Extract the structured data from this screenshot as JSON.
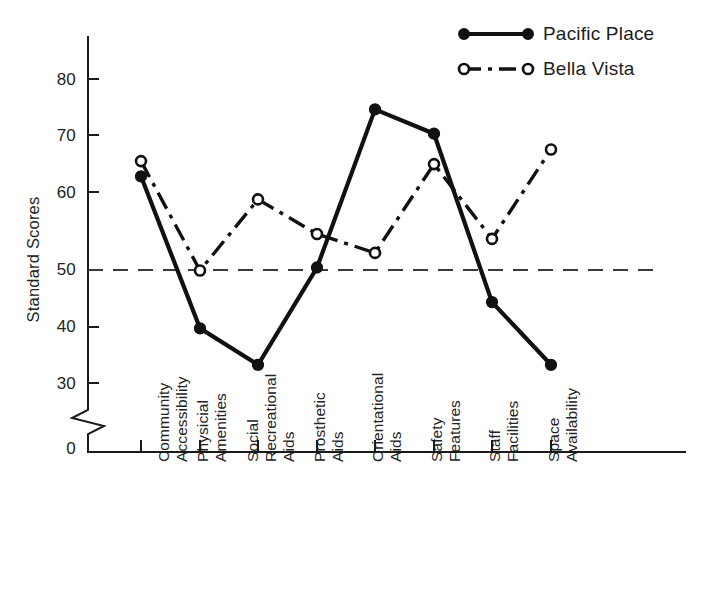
{
  "chart_data": {
    "type": "line",
    "title": "",
    "subtitle": "",
    "xlabel": "",
    "ylabel": "Standard Scores",
    "ylim": [
      28,
      86
    ],
    "yticks": [
      30,
      40,
      50,
      60,
      70,
      80
    ],
    "ytick_labels": [
      "30",
      "40",
      "50",
      "60",
      "70",
      "80"
    ],
    "y_origin_label": "0",
    "axis_break": true,
    "grid": false,
    "legend_position": "top-right",
    "reference_line": {
      "value": 50,
      "style": "dashed",
      "label": ""
    },
    "categories": [
      "Community Accessibility",
      "Physicial Amenities",
      "Social Recreational Aids",
      "Prosthetic Aids",
      "Orientational Aids",
      "Safety Features",
      "Staff Facilities",
      "Space Availability"
    ],
    "category_lines": [
      [
        "Community",
        "Accessibility"
      ],
      [
        "Physicial",
        "Amenities"
      ],
      [
        "Social",
        "Recreational",
        "Aids"
      ],
      [
        "Prosthetic",
        "Aids"
      ],
      [
        "Orientational",
        "Aids"
      ],
      [
        "Safety",
        "Features"
      ],
      [
        "Staff",
        "Facilities"
      ],
      [
        "Space",
        "Availability"
      ]
    ],
    "series": [
      {
        "name": "Pacific Place",
        "marker": "filled-circle",
        "line_style": "solid",
        "color": "#111111",
        "values": [
          64.0,
          39.0,
          33.0,
          49.0,
          75.0,
          71.0,
          43.3,
          33.0
        ]
      },
      {
        "name": "Bella Vista",
        "marker": "open-circle",
        "line_style": "dash-dot",
        "color": "#111111",
        "values": [
          66.5,
          48.5,
          60.2,
          54.5,
          51.4,
          66.0,
          53.7,
          68.4
        ]
      }
    ]
  },
  "legend": {
    "entries": [
      {
        "label": "Pacific Place"
      },
      {
        "label": "Bella Vista"
      }
    ]
  },
  "axis": {
    "y_title": "Standard Scores",
    "zero_label": "0"
  }
}
